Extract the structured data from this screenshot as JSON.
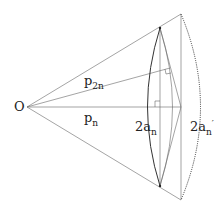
{
  "diagram": {
    "labels": {
      "origin": "O",
      "p2n_base": "p",
      "p2n_sub": "2n",
      "pn_base": "p",
      "pn_sub": "n",
      "an_base": "2a",
      "an_sub": "n",
      "anp_base": "2a",
      "anp_sub": "n",
      "anp_prime": "′"
    },
    "colors": {
      "line": "#555555",
      "text": "#222222"
    }
  }
}
